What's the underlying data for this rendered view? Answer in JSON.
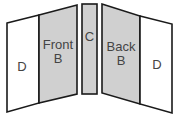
{
  "diagram": {
    "type": "book-cover-layout",
    "colors": {
      "panel_white": "#ffffff",
      "panel_gray": "#d0d0d0",
      "stroke": "#1a1a1a",
      "text": "#444444"
    },
    "panels": [
      {
        "id": "left-d",
        "lines": [
          "D"
        ],
        "fill": "white"
      },
      {
        "id": "front-b",
        "lines": [
          "Front",
          "B"
        ],
        "fill": "gray"
      },
      {
        "id": "c",
        "lines": [
          "C"
        ],
        "fill": "gray"
      },
      {
        "id": "back-b",
        "lines": [
          "Back",
          "B"
        ],
        "fill": "gray"
      },
      {
        "id": "right-d",
        "lines": [
          "D"
        ],
        "fill": "white"
      }
    ]
  }
}
